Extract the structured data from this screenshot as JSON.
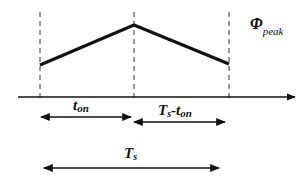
{
  "diagram": {
    "type": "triangular-waveform-timing",
    "colors": {
      "stroke": "#111111",
      "dash": "#333333",
      "background": "#ffffff"
    },
    "waveform": {
      "points": [
        [
          40,
          65
        ],
        [
          134,
          25
        ],
        [
          229,
          64
        ]
      ]
    },
    "dashed_lines_x": [
      40,
      134,
      229
    ],
    "axis": {
      "y": 97,
      "x_start": 18,
      "x_end": 295
    },
    "labels": {
      "phi_main": "Φ",
      "phi_sub": "peak",
      "ton_main": "t",
      "ton_sub": "on",
      "ts_minus_ton_main": "T",
      "ts_minus_ton_sub1": "s",
      "ts_minus_ton_dash": "-t",
      "ts_minus_ton_sub2": "on",
      "ts_main": "T",
      "ts_sub": "s"
    },
    "intervals": [
      {
        "name": "t_on",
        "x1": 40,
        "x2": 132,
        "y": 117
      },
      {
        "name": "Ts-t_on",
        "x1": 133,
        "x2": 226,
        "y": 122
      },
      {
        "name": "Ts",
        "x1": 43,
        "x2": 220,
        "y": 168
      }
    ]
  }
}
